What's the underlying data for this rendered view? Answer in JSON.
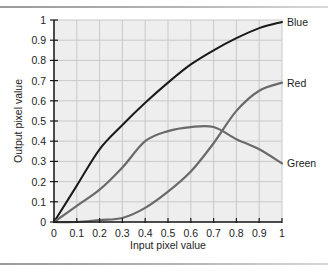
{
  "chart_data": {
    "type": "line",
    "title": "",
    "xlabel": "Input pixel value",
    "ylabel": "Output pixel value",
    "xlim": [
      0,
      1
    ],
    "ylim": [
      0,
      1
    ],
    "grid": true,
    "legend_position": "inline-right",
    "x_ticks": [
      "0",
      "0.1",
      "0.2",
      "0.3",
      "0.4",
      "0.5",
      "0.6",
      "0.7",
      "0.8",
      "0.9",
      "1"
    ],
    "y_ticks": [
      "0",
      "0.1",
      "0.2",
      "0.3",
      "0.4",
      "0.5",
      "0.6",
      "0.7",
      "0.8",
      "0.9",
      "1"
    ],
    "x": [
      0,
      0.1,
      0.2,
      0.3,
      0.4,
      0.5,
      0.6,
      0.7,
      0.8,
      0.9,
      1.0
    ],
    "series": [
      {
        "name": "Blue",
        "color": "#1a1a1a",
        "values": [
          0,
          0.18,
          0.36,
          0.48,
          0.59,
          0.69,
          0.78,
          0.85,
          0.91,
          0.96,
          0.99
        ]
      },
      {
        "name": "Red",
        "color": "#6a6a6a",
        "values": [
          0,
          0.0,
          0.01,
          0.02,
          0.07,
          0.15,
          0.25,
          0.39,
          0.55,
          0.65,
          0.69
        ]
      },
      {
        "name": "Green",
        "color": "#6a6a6a",
        "values": [
          0,
          0.08,
          0.16,
          0.27,
          0.4,
          0.45,
          0.47,
          0.47,
          0.41,
          0.36,
          0.29
        ]
      }
    ]
  },
  "plot": {
    "background": "#eeeeee",
    "grid_color": "#c9c9c9",
    "axis_color": "#1a1a1a"
  }
}
